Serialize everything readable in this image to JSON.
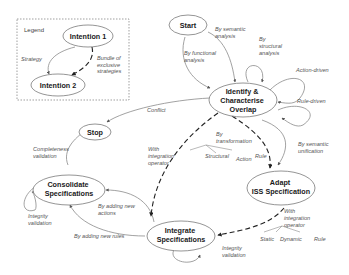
{
  "legend": {
    "title": "Legend",
    "intention1": "Intention 1",
    "intention2": "Intention 2",
    "strategy": "Strategy",
    "bundle": [
      "Bundle of",
      "exclusive",
      "strategies"
    ]
  },
  "nodes": {
    "start": "Start",
    "identify": [
      "Identify &",
      "Characterise",
      "Overlap"
    ],
    "stop": "Stop",
    "consolidate": [
      "Consolidate",
      "Specifications"
    ],
    "adapt": [
      "Adapt",
      "ISS Specification"
    ],
    "integrate": [
      "Integrate",
      "Specifications"
    ]
  },
  "edges": {
    "semantic_analysis": [
      "By semantic",
      "analysis"
    ],
    "functional_analysis": [
      "By functional",
      "analysis"
    ],
    "structural_analysis": [
      "By",
      "structural",
      "analysis"
    ],
    "action_driven": "Action-driven",
    "rule_driven": "Rule-driven",
    "conflict": "Conflict",
    "completeness": [
      "Completeness",
      "validation"
    ],
    "integrity_consolidate": [
      "Integrity",
      "validation"
    ],
    "with_integration_op_1": [
      "With",
      "integration",
      "operator"
    ],
    "by_transformation": [
      "By",
      "transformation"
    ],
    "transformation_sub": [
      "Structural",
      "Action",
      "Rule"
    ],
    "semantic_unification": [
      "By semantic",
      "unification"
    ],
    "adding_actions": [
      "By adding new",
      "actions"
    ],
    "adding_rules": "By adding new rules",
    "integrity_integrate": [
      "Integrity",
      "validation"
    ],
    "with_integration_op_2": [
      "With",
      "integration",
      "operator"
    ],
    "operator_sub": [
      "Static",
      "Dynamic",
      "Rule"
    ]
  }
}
